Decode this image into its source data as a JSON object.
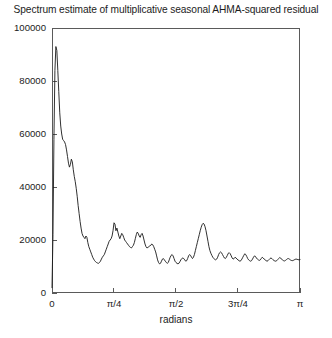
{
  "chart_data": {
    "type": "line",
    "title": "Spectrum estimate of multiplicative seasonal AHMA-squared residual",
    "xlabel": "radians",
    "ylabel": "",
    "xlim": [
      0,
      3.14159265
    ],
    "ylim": [
      0,
      100000
    ],
    "grid": false,
    "legend": null,
    "xticks": [
      0,
      0.785398,
      1.570796,
      2.356194,
      3.141593
    ],
    "xticklabels": [
      "0",
      "π/4",
      "π/2",
      "3π/4",
      "π"
    ],
    "yticks": [
      0,
      20000,
      40000,
      60000,
      80000,
      100000
    ],
    "yticklabels": [
      "0",
      "20000",
      "40000",
      "60000",
      "80000",
      "100000"
    ],
    "series": [
      {
        "name": "spectrum estimate",
        "color": "#1a1a1a",
        "x": [
          0.0,
          0.0123,
          0.0245,
          0.0368,
          0.0491,
          0.0614,
          0.0736,
          0.0859,
          0.0982,
          0.1104,
          0.1227,
          0.135,
          0.1473,
          0.1595,
          0.1718,
          0.1841,
          0.1963,
          0.2086,
          0.2209,
          0.2332,
          0.2454,
          0.2577,
          0.27,
          0.2822,
          0.2945,
          0.3068,
          0.3191,
          0.3313,
          0.3436,
          0.3559,
          0.3682,
          0.3804,
          0.3927,
          0.405,
          0.4172,
          0.4295,
          0.4418,
          0.4541,
          0.4663,
          0.4786,
          0.4909,
          0.5031,
          0.5154,
          0.5277,
          0.54,
          0.5522,
          0.5645,
          0.5768,
          0.589,
          0.6013,
          0.6136,
          0.6259,
          0.6381,
          0.6504,
          0.6627,
          0.675,
          0.6872,
          0.6995,
          0.7118,
          0.724,
          0.7363,
          0.7486,
          0.7609,
          0.7731,
          0.7854,
          0.7977,
          0.8099,
          0.8222,
          0.8345,
          0.8468,
          0.859,
          0.8713,
          0.8836,
          0.8958,
          0.9081,
          0.9204,
          0.9327,
          0.9449,
          0.9572,
          0.9695,
          0.9817,
          0.994,
          1.0063,
          1.0186,
          1.0308,
          1.0431,
          1.0554,
          1.0677,
          1.0799,
          1.0922,
          1.1045,
          1.1167,
          1.129,
          1.1413,
          1.1536,
          1.1658,
          1.1781,
          1.1904,
          1.2026,
          1.2149,
          1.2272,
          1.2395,
          1.2517,
          1.264,
          1.2763,
          1.2885,
          1.3008,
          1.3131,
          1.3254,
          1.3376,
          1.3499,
          1.3622,
          1.3744,
          1.3867,
          1.399,
          1.4113,
          1.4235,
          1.4358,
          1.4481,
          1.4603,
          1.4726,
          1.4849,
          1.4972,
          1.5094,
          1.5217,
          1.534,
          1.5462,
          1.5585,
          1.5708,
          1.5831,
          1.5953,
          1.6076,
          1.6199,
          1.6322,
          1.6444,
          1.6567,
          1.669,
          1.6812,
          1.6935,
          1.7058,
          1.7181,
          1.7303,
          1.7426,
          1.7549,
          1.7671,
          1.7794,
          1.7917,
          1.804,
          1.8162,
          1.8285,
          1.8408,
          1.853,
          1.8653,
          1.8776,
          1.8899,
          1.9021,
          1.9144,
          1.9267,
          1.9389,
          1.9512,
          1.9635,
          1.9758,
          1.988,
          2.0003,
          2.0126,
          2.0248,
          2.0371,
          2.0494,
          2.0617,
          2.0739,
          2.0862,
          2.0985,
          2.1107,
          2.123,
          2.1353,
          2.1476,
          2.1598,
          2.1721,
          2.1844,
          2.1966,
          2.2089,
          2.2212,
          2.2335,
          2.2457,
          2.258,
          2.2703,
          2.2825,
          2.2948,
          2.3071,
          2.3194,
          2.3316,
          2.3439,
          2.3562,
          2.3684,
          2.3807,
          2.393,
          2.4053,
          2.4175,
          2.4298,
          2.4421,
          2.4543,
          2.4666,
          2.4789,
          2.4912,
          2.5034,
          2.5157,
          2.528,
          2.5402,
          2.5525,
          2.5648,
          2.5771,
          2.5893,
          2.6016,
          2.6139,
          2.6261,
          2.6384,
          2.6507,
          2.663,
          2.6752,
          2.6875,
          2.6998,
          2.712,
          2.7243,
          2.7366,
          2.7489,
          2.7611,
          2.7734,
          2.7857,
          2.7979,
          2.8102,
          2.8225,
          2.8348,
          2.847,
          2.8593,
          2.8716,
          2.8838,
          2.8961,
          2.9084,
          2.9207,
          2.9329,
          2.9452,
          2.9575,
          2.9697,
          2.982,
          2.9943,
          3.0066,
          3.0188,
          3.0311,
          3.0434,
          3.0556,
          3.0679,
          3.0802,
          3.0925,
          3.1047,
          3.117,
          3.1293,
          3.1416
        ],
        "y": [
          2000,
          22000,
          58000,
          84000,
          93000,
          91500,
          84000,
          76000,
          68000,
          63000,
          60000,
          58000,
          57500,
          57000,
          56000,
          54000,
          51500,
          49000,
          47500,
          48500,
          50500,
          49500,
          46500,
          44000,
          42000,
          39500,
          36500,
          33000,
          30000,
          27000,
          24500,
          22500,
          21500,
          21000,
          20500,
          21500,
          21000,
          19000,
          17500,
          16500,
          15500,
          14500,
          13500,
          12800,
          12200,
          11800,
          11500,
          11300,
          11200,
          11500,
          12000,
          12800,
          13500,
          14000,
          14500,
          15500,
          16500,
          17500,
          18500,
          19500,
          20000,
          20500,
          21500,
          23500,
          26500,
          26000,
          23500,
          24500,
          23000,
          21500,
          20500,
          21500,
          22500,
          22000,
          21000,
          20000,
          19500,
          19000,
          18500,
          18000,
          17500,
          17200,
          17000,
          17500,
          18000,
          19000,
          20500,
          22000,
          23000,
          22500,
          21500,
          21000,
          22000,
          22500,
          21500,
          20000,
          18500,
          17500,
          17000,
          17200,
          17500,
          17800,
          18000,
          18500,
          18200,
          17500,
          16500,
          15500,
          14000,
          12500,
          11500,
          11000,
          11200,
          12000,
          12800,
          13000,
          12500,
          12000,
          11500,
          11200,
          11500,
          12500,
          13500,
          14200,
          14500,
          14000,
          13000,
          12000,
          11500,
          11200,
          11000,
          11200,
          11800,
          12500,
          13000,
          13200,
          13000,
          12500,
          12000,
          12200,
          13000,
          14000,
          14500,
          14200,
          13500,
          13000,
          13500,
          14500,
          16000,
          17500,
          19000,
          20500,
          22000,
          23500,
          24800,
          25800,
          26300,
          26000,
          25000,
          23500,
          21500,
          19500,
          17500,
          16000,
          15000,
          14200,
          13500,
          13000,
          12700,
          12500,
          12800,
          13500,
          14500,
          15200,
          15500,
          15200,
          14500,
          13800,
          13200,
          13000,
          13500,
          14200,
          15000,
          15200,
          14800,
          14000,
          13200,
          12800,
          13000,
          13500,
          13200,
          12800,
          12500,
          12200,
          12000,
          12200,
          12800,
          13500,
          14200,
          14800,
          14500,
          13800,
          13000,
          12500,
          12200,
          12000,
          12200,
          12800,
          13500,
          14000,
          13800,
          13200,
          12800,
          12500,
          12300,
          12500,
          13000,
          13500,
          13200,
          12800,
          12500,
          12200,
          12000,
          12200,
          12600,
          13000,
          13200,
          13000,
          12600,
          12300,
          12100,
          12000,
          12200,
          12600,
          13000,
          13400,
          13200,
          12800,
          12400,
          12200,
          12100,
          12300,
          12600,
          12900,
          13000,
          12800,
          12500,
          12300,
          12200,
          12300,
          12500,
          12700,
          12800,
          12700,
          12600,
          12500,
          12600
        ]
      }
    ]
  }
}
